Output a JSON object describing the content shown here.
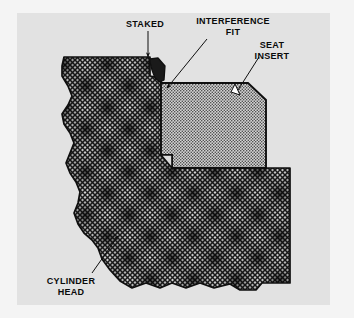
{
  "figure": {
    "background_color": "#f4f4f4",
    "panel_color": "#e2e2e2",
    "line_color": "#111111",
    "hatch_dark_color": "#2b2b2b",
    "hatch_light_color": "#6d6d6d",
    "insert_fill_color": "#cfcfcf",
    "insert_dot_color": "#4a4a4a"
  },
  "labels": {
    "staked": "STAKED",
    "interference_fit": "INTERFERENCE\nFIT",
    "seat_insert": "SEAT\nINSERT",
    "cylinder_head": "CYLINDER\nHEAD"
  },
  "leaders": {
    "staked": {
      "from": [
        148,
        30
      ],
      "to": [
        148,
        62
      ],
      "arrow": "down"
    },
    "interference_fit": {
      "from": [
        206,
        38
      ],
      "to": [
        166,
        90
      ],
      "arrow": "down-left"
    },
    "seat_insert": {
      "from": [
        258,
        56
      ],
      "to": [
        235,
        98
      ],
      "arrow": "down-left-hollow"
    },
    "cylinder_head": {
      "from": [
        94,
        272
      ],
      "to": [
        119,
        235
      ],
      "arrow": "up-right"
    }
  },
  "parts": [
    {
      "name": "cylinder-head",
      "fill": "crosshatch-dark",
      "label": "CYLINDER HEAD"
    },
    {
      "name": "seat-insert",
      "fill": "stipple-light",
      "label": "SEAT INSERT"
    },
    {
      "name": "staked-tab",
      "fill": "solid-dark",
      "label": "STAKED"
    }
  ]
}
